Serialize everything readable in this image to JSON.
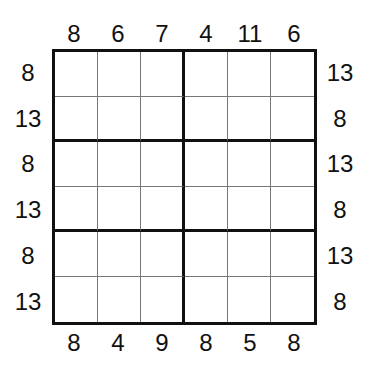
{
  "puzzle": {
    "type": "sudoku-sandwich-clues",
    "size": 6,
    "clues": {
      "top": [
        "8",
        "6",
        "7",
        "4",
        "11",
        "6"
      ],
      "bottom": [
        "8",
        "4",
        "9",
        "8",
        "5",
        "8"
      ],
      "left": [
        "8",
        "13",
        "8",
        "13",
        "8",
        "13"
      ],
      "right": [
        "13",
        "8",
        "13",
        "8",
        "13",
        "8"
      ]
    },
    "cells": [
      [
        "",
        "",
        "",
        "",
        "",
        ""
      ],
      [
        "",
        "",
        "",
        "",
        "",
        ""
      ],
      [
        "",
        "",
        "",
        "",
        "",
        ""
      ],
      [
        "",
        "",
        "",
        "",
        "",
        ""
      ],
      [
        "",
        "",
        "",
        "",
        "",
        ""
      ],
      [
        "",
        "",
        "",
        "",
        "",
        ""
      ]
    ],
    "colors": {
      "thick_line": "#111111",
      "thin_line": "#777777",
      "background": "#ffffff"
    }
  }
}
